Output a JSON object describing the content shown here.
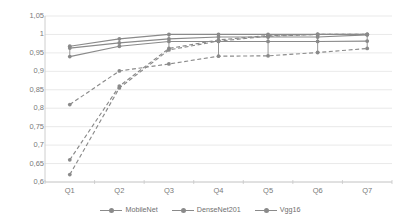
{
  "chart_data": {
    "type": "line",
    "title": "",
    "xlabel": "",
    "ylabel": "",
    "categories": [
      "Q1",
      "Q2",
      "Q3",
      "Q4",
      "Q5",
      "Q6",
      "Q7"
    ],
    "ylim": [
      0.6,
      1.05
    ],
    "ytick_labels": [
      "1,05",
      "1",
      "0,95",
      "0,9",
      "0,85",
      "0,8",
      "0,75",
      "0,7",
      "0,65",
      "0,6"
    ],
    "ytick_values": [
      1.05,
      1.0,
      0.95,
      0.9,
      0.85,
      0.8,
      0.75,
      0.7,
      0.65,
      0.6
    ],
    "grid": true,
    "legend_position": "bottom",
    "line_color": "#8a8a8a",
    "series": [
      {
        "name": "MobileNet",
        "style": "solid",
        "marker": "circle",
        "values": [
          0.968,
          0.988,
          1.0,
          1.0,
          1.0,
          1.0,
          1.0
        ]
      },
      {
        "name": "DenseNet201",
        "style": "solid",
        "marker": "circle",
        "values": [
          0.963,
          0.977,
          0.988,
          0.993,
          0.993,
          0.993,
          0.999
        ]
      },
      {
        "name": "Vgg16",
        "style": "solid",
        "marker": "circle",
        "values": [
          0.94,
          0.968,
          0.981,
          0.981,
          0.981,
          0.981,
          0.982
        ]
      },
      {
        "name": "MobileNet",
        "style": "dashed",
        "marker": "circle",
        "values": [
          0.81,
          0.901,
          0.92,
          0.941,
          0.942,
          0.951,
          0.962
        ]
      },
      {
        "name": "DenseNet201",
        "style": "dashed",
        "marker": "circle",
        "values": [
          0.66,
          0.86,
          0.962,
          0.985,
          0.997,
          1.0,
          1.0
        ]
      },
      {
        "name": "Vgg16",
        "style": "dashed",
        "marker": "circle",
        "values": [
          0.62,
          0.855,
          0.958,
          0.982,
          0.995,
          1.0,
          1.0
        ]
      }
    ],
    "legend": [
      {
        "label": "MobileNet",
        "color": "#8a8a8a"
      },
      {
        "label": "DenseNet201",
        "color": "#8a8a8a"
      },
      {
        "label": "Vgg16",
        "color": "#8a8a8a"
      }
    ]
  }
}
